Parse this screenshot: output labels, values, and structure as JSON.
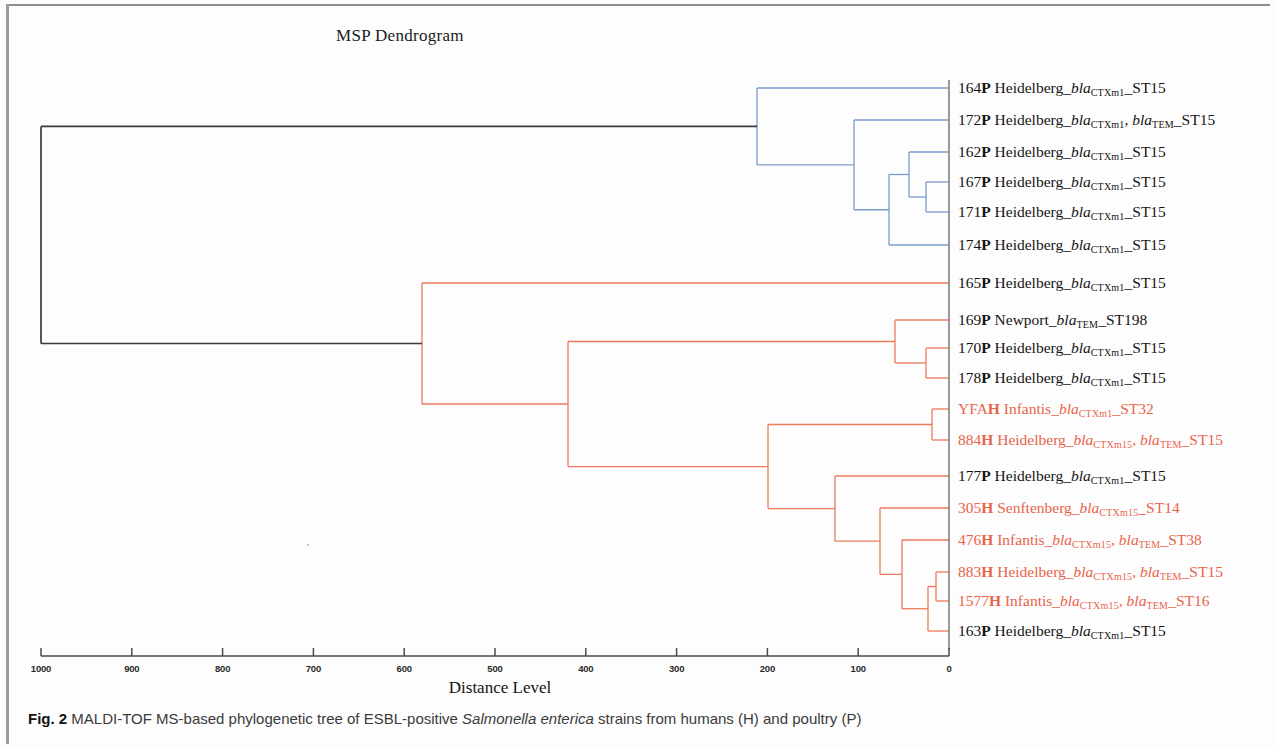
{
  "figure": {
    "title": "MSP Dendrogram",
    "axis_title": "Distance Level",
    "caption_prefix": "Fig. 2",
    "caption_part1": " MALDI-TOF MS-based phylogenetic tree of ESBL-positive ",
    "caption_italic": "Salmonella enterica",
    "caption_part2": " strains from humans (H) and poultry (P)"
  },
  "colors": {
    "blue_cluster": "#7b9ccb",
    "red_cluster": "#ee7a5e",
    "root_black": "#3b3b3b",
    "red_text": "#e9644a",
    "black_text": "#141414",
    "axis": "#4a4a4a"
  },
  "axis": {
    "label": "Distance Level",
    "ticks": [
      1000,
      900,
      800,
      700,
      600,
      500,
      400,
      300,
      200,
      100,
      0
    ],
    "min": 0,
    "max": 1000,
    "x_pixel_at_zero": 949,
    "px_per_unit": 0.908
  },
  "leaves": [
    {
      "id": "164P",
      "num": "164",
      "src": "P",
      "serovar": "Heidelberg",
      "genes": [
        {
          "name": "bla",
          "sub": "CTXm1"
        }
      ],
      "st": "ST15",
      "color": "black",
      "cluster": "blue"
    },
    {
      "id": "172P",
      "num": "172",
      "src": "P",
      "serovar": "Heidelberg",
      "genes": [
        {
          "name": "bla",
          "sub": "CTXm1"
        },
        {
          "name": "bla",
          "sub": "TEM"
        }
      ],
      "st": "ST15",
      "color": "black",
      "cluster": "blue"
    },
    {
      "id": "162P",
      "num": "162",
      "src": "P",
      "serovar": "Heidelberg",
      "genes": [
        {
          "name": "bla",
          "sub": "CTXm1"
        }
      ],
      "st": "ST15",
      "color": "black",
      "cluster": "blue"
    },
    {
      "id": "167P",
      "num": "167",
      "src": "P",
      "serovar": "Heidelberg",
      "genes": [
        {
          "name": "bla",
          "sub": "CTXm1"
        }
      ],
      "st": "ST15",
      "color": "black",
      "cluster": "blue"
    },
    {
      "id": "171P",
      "num": "171",
      "src": "P",
      "serovar": "Heidelberg",
      "genes": [
        {
          "name": "bla",
          "sub": "CTXm1"
        }
      ],
      "st": "ST15",
      "color": "black",
      "cluster": "blue"
    },
    {
      "id": "174P",
      "num": "174",
      "src": "P",
      "serovar": "Heidelberg",
      "genes": [
        {
          "name": "bla",
          "sub": "CTXm1"
        }
      ],
      "st": "ST15",
      "color": "black",
      "cluster": "blue"
    },
    {
      "id": "165P",
      "num": "165",
      "src": "P",
      "serovar": "Heidelberg",
      "genes": [
        {
          "name": "bla",
          "sub": "CTXm1"
        }
      ],
      "st": "ST15",
      "color": "black",
      "cluster": "red"
    },
    {
      "id": "169P",
      "num": "169",
      "src": "P",
      "serovar": "Newport",
      "genes": [
        {
          "name": "bla",
          "sub": "TEM"
        }
      ],
      "st": "ST198",
      "color": "black",
      "cluster": "red"
    },
    {
      "id": "170P",
      "num": "170",
      "src": "P",
      "serovar": "Heidelberg",
      "genes": [
        {
          "name": "bla",
          "sub": "CTXm1"
        }
      ],
      "st": "ST15",
      "color": "black",
      "cluster": "red"
    },
    {
      "id": "178P",
      "num": "178",
      "src": "P",
      "serovar": "Heidelberg",
      "genes": [
        {
          "name": "bla",
          "sub": "CTXm1"
        }
      ],
      "st": "ST15",
      "color": "black",
      "cluster": "red"
    },
    {
      "id": "YFAH",
      "num": "YFA",
      "src": "H",
      "serovar": "Infantis",
      "genes": [
        {
          "name": "bla",
          "sub": "CTXm1"
        }
      ],
      "st": "ST32",
      "color": "red",
      "cluster": "red"
    },
    {
      "id": "884H",
      "num": "884",
      "src": "H",
      "serovar": "Heidelberg",
      "genes": [
        {
          "name": "bla",
          "sub": "CTXm15"
        },
        {
          "name": "bla",
          "sub": "TEM"
        }
      ],
      "st": "ST15",
      "color": "red",
      "cluster": "red"
    },
    {
      "id": "177P",
      "num": "177",
      "src": "P",
      "serovar": "Heidelberg",
      "genes": [
        {
          "name": "bla",
          "sub": "CTXm1"
        }
      ],
      "st": "ST15",
      "color": "black",
      "cluster": "red"
    },
    {
      "id": "305H",
      "num": "305",
      "src": "H",
      "serovar": "Senftenberg",
      "genes": [
        {
          "name": "bla",
          "sub": "CTXm15"
        }
      ],
      "st": "ST14",
      "color": "red",
      "cluster": "red"
    },
    {
      "id": "476H",
      "num": "476",
      "src": "H",
      "serovar": "Infantis",
      "genes": [
        {
          "name": "bla",
          "sub": "CTXm15"
        },
        {
          "name": "bla",
          "sub": "TEM"
        }
      ],
      "st": "ST38",
      "color": "red",
      "cluster": "red"
    },
    {
      "id": "883H",
      "num": "883",
      "src": "H",
      "serovar": "Heidelberg",
      "genes": [
        {
          "name": "bla",
          "sub": "CTXm15"
        },
        {
          "name": "bla",
          "sub": "TEM"
        }
      ],
      "st": "ST15",
      "color": "red",
      "cluster": "red"
    },
    {
      "id": "1577H",
      "num": "1577",
      "src": "H",
      "serovar": "Infantis",
      "genes": [
        {
          "name": "bla",
          "sub": "CTXm15"
        },
        {
          "name": "bla",
          "sub": "TEM"
        }
      ],
      "st": "ST16",
      "color": "red",
      "cluster": "red"
    },
    {
      "id": "163P",
      "num": "163",
      "src": "P",
      "serovar": "Heidelberg",
      "genes": [
        {
          "name": "bla",
          "sub": "CTXm1"
        }
      ],
      "st": "ST15",
      "color": "black",
      "cluster": "red"
    }
  ],
  "leaf_labels_text": [
    "164P Heidelberg_blaCTXm1_ST15",
    "172P Heidelberg_blaCTXm1, blaTEM_ST15",
    "162P Heidelberg_blaCTXm1_ST15",
    "167P Heidelberg_blaCTXm1_ST15",
    "171P Heidelberg_blaCTXm1_ST15",
    "174P Heidelberg_blaCTXm1_ST15",
    "165P Heidelberg_blaCTXm1_ST15",
    "169P Newport_blaTEM_ST198",
    "170P Heidelberg_blaCTXm1_ST15",
    "178P Heidelberg_blaCTXm1_ST15",
    "YFAH Infantis_blaCTXm1_ST32",
    "884H Heidelberg_blaCTXm15, blaTEM_ST15",
    "177P Heidelberg_blaCTXm1_ST15",
    "305H Senftenberg_blaCTXm15_ST14",
    "476H Infantis_blaCTXm15, blaTEM_ST38",
    "883H Heidelberg_blaCTXm15, blaTEM_ST15",
    "1577H Infantis_blaCTXm15, blaTEM_ST16",
    "163P Heidelberg_blaCTXm1_ST15"
  ],
  "chart_data": {
    "type": "dendrogram",
    "title": "MSP Dendrogram",
    "xlabel": "Distance Level",
    "ylabel": "",
    "xlim": [
      1000,
      0
    ],
    "x_ticks": [
      1000,
      900,
      800,
      700,
      600,
      500,
      400,
      300,
      200,
      100,
      0
    ],
    "x_axis_inverted": true,
    "grid": false,
    "legend": "none",
    "orientation": "horizontal-right-to-left",
    "leaf_order": [
      "164P",
      "172P",
      "162P",
      "167P",
      "171P",
      "174P",
      "165P",
      "169P",
      "170P",
      "178P",
      "YFAH",
      "884H",
      "177P",
      "305H",
      "476H",
      "883H",
      "1577H",
      "163P"
    ],
    "n_leaves": 18,
    "leaf_y_px": [
      88,
      120,
      152,
      182,
      212,
      245,
      283,
      320,
      348,
      378,
      409,
      440,
      476,
      508,
      540,
      572,
      601,
      631
    ],
    "merges": [
      {
        "id": "m1",
        "children": [
          "167P",
          "171P"
        ],
        "distance": 25,
        "color": "blue",
        "x_px": 926,
        "y_px": 197
      },
      {
        "id": "m2",
        "children": [
          "162P",
          "m1"
        ],
        "distance": 44,
        "color": "blue",
        "x_px": 909,
        "y_px": 175
      },
      {
        "id": "m3",
        "children": [
          "m2",
          "174P"
        ],
        "distance": 66,
        "color": "blue",
        "x_px": 889,
        "y_px": 210
      },
      {
        "id": "m4",
        "children": [
          "172P",
          "m3"
        ],
        "distance": 105,
        "color": "blue",
        "x_px": 854,
        "y_px": 165
      },
      {
        "id": "m5",
        "children": [
          "164P",
          "m4"
        ],
        "distance": 212,
        "color": "blue",
        "x_px": 757,
        "y_px": 127
      },
      {
        "id": "m6",
        "children": [
          "170P",
          "178P"
        ],
        "distance": 25,
        "color": "red",
        "x_px": 926,
        "y_px": 363
      },
      {
        "id": "m7",
        "children": [
          "169P",
          "m6"
        ],
        "distance": 60,
        "color": "red",
        "x_px": 895,
        "y_px": 341
      },
      {
        "id": "m8",
        "children": [
          "YFAH",
          "884H"
        ],
        "distance": 19,
        "color": "red",
        "x_px": 932,
        "y_px": 425
      },
      {
        "id": "m9",
        "children": [
          "883H",
          "1577H"
        ],
        "distance": 14,
        "color": "red",
        "x_px": 936,
        "y_px": 586
      },
      {
        "id": "m10",
        "children": [
          "m9",
          "163P"
        ],
        "distance": 23,
        "color": "red",
        "x_px": 928,
        "y_px": 609
      },
      {
        "id": "m11",
        "children": [
          "476H",
          "m10"
        ],
        "distance": 52,
        "color": "red",
        "x_px": 902,
        "y_px": 575
      },
      {
        "id": "m12",
        "children": [
          "305H",
          "m11"
        ],
        "distance": 76,
        "color": "red",
        "x_px": 880,
        "y_px": 541
      },
      {
        "id": "m13",
        "children": [
          "177P",
          "m12"
        ],
        "distance": 126,
        "color": "red",
        "x_px": 835,
        "y_px": 508
      },
      {
        "id": "m14",
        "children": [
          "m8",
          "m13"
        ],
        "distance": 199,
        "color": "red",
        "x_px": 768,
        "y_px": 467
      },
      {
        "id": "m15",
        "children": [
          "m7",
          "m14"
        ],
        "distance": 420,
        "color": "red",
        "x_px": 568,
        "y_px": 404
      },
      {
        "id": "m16",
        "children": [
          "165P",
          "m15"
        ],
        "distance": 580,
        "color": "red",
        "x_px": 422,
        "y_px": 344
      },
      {
        "id": "m17",
        "children": [
          "m5",
          "m16"
        ],
        "distance": 1000,
        "color": "black",
        "x_px": 41,
        "y_px": 236
      }
    ],
    "cluster_colors": {
      "blue": "#7b9ccb",
      "red": "#ee7a5e",
      "root": "#3b3b3b"
    }
  }
}
